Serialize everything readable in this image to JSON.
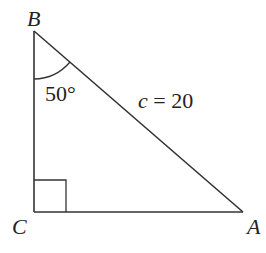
{
  "diagram": {
    "type": "right-triangle",
    "vertices": {
      "B": {
        "label": "B",
        "x": 34,
        "y": 31
      },
      "C": {
        "label": "C",
        "x": 34,
        "y": 212
      },
      "A": {
        "label": "A",
        "x": 243,
        "y": 212
      }
    },
    "right_angle_at": "C",
    "angle_label": "50°",
    "angle_at": "B",
    "hypotenuse_label_var": "c",
    "hypotenuse_label_rest": " = 20",
    "colors": {
      "stroke": "#333333",
      "text": "#222222"
    }
  }
}
